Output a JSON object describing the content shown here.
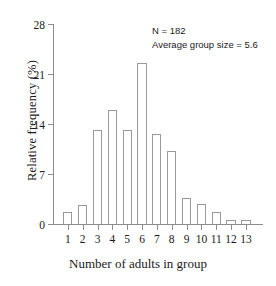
{
  "chart_data": {
    "type": "bar",
    "title": "",
    "xlabel": "Number of adults in group",
    "ylabel": "Relative frequency (%)",
    "categories": [
      "1",
      "2",
      "3",
      "4",
      "5",
      "6",
      "7",
      "8",
      "9",
      "10",
      "11",
      "12",
      "13"
    ],
    "values": [
      1.7,
      2.6,
      13.2,
      16.0,
      13.2,
      22.5,
      12.6,
      10.2,
      3.6,
      2.8,
      1.7,
      0.6,
      0.6
    ],
    "ylim": [
      0,
      28
    ],
    "yticks": [
      0,
      7,
      14,
      21,
      28
    ],
    "ytick_labels": [
      "0",
      "7",
      "14",
      "21",
      "28"
    ],
    "xticks": [
      1,
      2,
      3,
      4,
      5,
      6,
      7,
      8,
      9,
      10,
      11,
      12,
      13
    ],
    "grid": false,
    "legend": null,
    "bar_fill_color": "#ffffff",
    "bar_edge_color": "#9a9a9a",
    "axis_color": "#8d8d8d",
    "annotations": [
      "N = 182",
      "Average group size = 5.6"
    ]
  }
}
